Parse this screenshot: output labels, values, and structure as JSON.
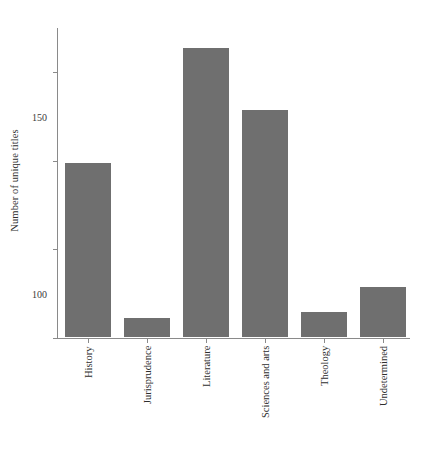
{
  "chart_data": {
    "type": "bar",
    "title": "",
    "xlabel": "",
    "ylabel": "Number of unique titles",
    "categories": [
      "History",
      "Jurisprudence",
      "Literature",
      "Sciences and arts",
      "Theology",
      "Undetermined"
    ],
    "values": [
      98,
      11,
      163,
      128,
      14,
      28
    ],
    "ylim": [
      0,
      175
    ],
    "yticks": [
      0,
      50,
      100,
      150
    ],
    "ytick_labels": [
      "0",
      "50",
      "100",
      "150"
    ],
    "grid": false,
    "legend": null,
    "bar_color": "#6f6f6f",
    "axis_color": "#8a8a8a",
    "background": "#ffffff"
  }
}
